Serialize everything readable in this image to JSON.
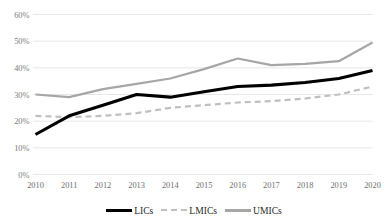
{
  "chart_data": {
    "type": "line",
    "title": "",
    "subtitle": "",
    "xlabel": "",
    "ylabel": "",
    "grid": true,
    "legend_position": "bottom",
    "x": [
      "2010",
      "2011",
      "2012",
      "2013",
      "2014",
      "2015",
      "2016",
      "2017",
      "2018",
      "2019",
      "2020"
    ],
    "xlim": [
      "2010",
      "2020"
    ],
    "ylim": [
      0,
      60
    ],
    "ytick_values": [
      0,
      10,
      20,
      30,
      40,
      50,
      60
    ],
    "ytick_labels": [
      "0%",
      "10%",
      "20%",
      "30%",
      "40%",
      "50%",
      "60%"
    ],
    "y_unit": "%",
    "series": [
      {
        "name": "LICs",
        "style": "solid",
        "color": "#000000",
        "width": 3.1,
        "values": [
          15,
          22,
          26,
          30,
          29,
          31,
          33,
          33.5,
          34.5,
          36,
          39
        ]
      },
      {
        "name": "LMICs",
        "style": "dashed",
        "color": "#bfbfbf",
        "width": 2.2,
        "values": [
          22,
          21.5,
          22,
          23,
          25,
          26,
          27,
          27.5,
          28.5,
          30,
          33
        ]
      },
      {
        "name": "UMICs",
        "style": "solid",
        "color": "#a6a6a6",
        "width": 2.2,
        "values": [
          30,
          29,
          32,
          34,
          36,
          39.5,
          43.5,
          41,
          41.5,
          42.5,
          49.5
        ]
      }
    ]
  },
  "legend": {
    "entries": [
      {
        "label": "LICs",
        "swatch": "solid-black-line"
      },
      {
        "label": "LMICs",
        "swatch": "dashed-gray-line"
      },
      {
        "label": "UMICs",
        "swatch": "solid-gray-line"
      }
    ]
  },
  "colors": {
    "lics": "#000000",
    "lmics": "#bfbfbf",
    "umics": "#a6a6a6",
    "grid": "#e4e4e4",
    "tick_text": "#757575",
    "background": "#ffffff"
  }
}
